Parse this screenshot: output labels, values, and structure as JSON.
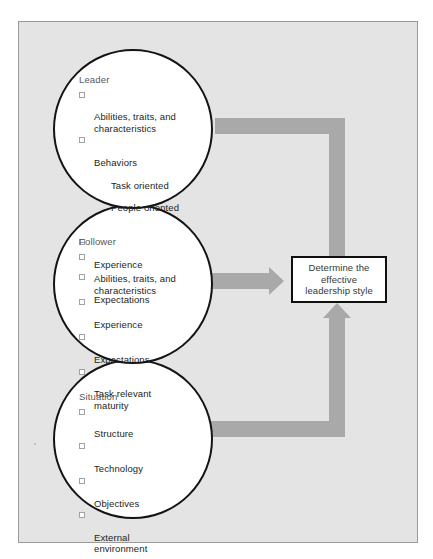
{
  "figure": {
    "background_color": "#e4e4e4",
    "border_color": "#9a9a9a",
    "arrow_color": "#a9a9a9",
    "circle_outline_color": "#141414"
  },
  "circles": [
    {
      "key": "leader",
      "title": "Leader",
      "items": [
        {
          "label": "Abilities, traits, and\ncharacteristics",
          "checkbox": true,
          "subitems": []
        },
        {
          "label": "Behaviors",
          "checkbox": true,
          "subitems": [
            "Task oriented",
            "People oriented"
          ]
        },
        {
          "label": "Experience",
          "checkbox": true,
          "subitems": []
        },
        {
          "label": "Expectations",
          "checkbox": true,
          "subitems": []
        }
      ]
    },
    {
      "key": "follower",
      "title": "Follower",
      "items": [
        {
          "label": "Abilities, traits, and\ncharacteristics",
          "checkbox": true,
          "subitems": []
        },
        {
          "label": "Experience",
          "checkbox": true,
          "subitems": []
        },
        {
          "label": "Expectations",
          "checkbox": true,
          "subitems": []
        },
        {
          "label": "Task relevant\nmaturity",
          "checkbox": true,
          "subitems": []
        }
      ]
    },
    {
      "key": "situation",
      "title": "Situation",
      "items": [
        {
          "label": "Structure",
          "checkbox": true,
          "subitems": []
        },
        {
          "label": "Technology",
          "checkbox": true,
          "subitems": []
        },
        {
          "label": "Objectives",
          "checkbox": true,
          "subitems": []
        },
        {
          "label": "External\nenvironment",
          "checkbox": true,
          "subitems": []
        }
      ]
    }
  ],
  "result_box": {
    "label": "Determine the\neffective\nleadership style"
  }
}
